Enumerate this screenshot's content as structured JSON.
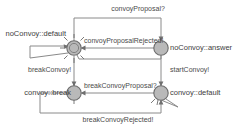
{
  "diagram": {
    "type": "state-machine",
    "colors": {
      "node_fill": "#b9b9b9",
      "node_stroke": "#6c6c6c",
      "edge_stroke": "#8a8a8a",
      "label_text": "#3d3d3d",
      "background": "#ffffff"
    },
    "nodes": [
      {
        "id": "noConvoy_default",
        "label": "noConvoy::default",
        "shape": "double-circle",
        "x": 74,
        "y": 48,
        "r": 7,
        "label_anchor": "end",
        "label_x": 66,
        "label_y": 36
      },
      {
        "id": "noConvoy_answer",
        "label": "noConvoy::answer",
        "shape": "circle",
        "x": 161,
        "y": 48,
        "r": 7,
        "label_anchor": "start",
        "label_x": 170,
        "label_y": 50
      },
      {
        "id": "convoy_break",
        "label": "convoy::break",
        "shape": "circle",
        "x": 74,
        "y": 93,
        "r": 7,
        "label_anchor": "end",
        "label_x": 70,
        "label_y": 95
      },
      {
        "id": "convoy_default",
        "label": "convoy::default",
        "shape": "circle",
        "x": 161,
        "y": 93,
        "r": 7,
        "label_anchor": "start",
        "label_x": 170,
        "label_y": 95
      }
    ],
    "edges": [
      {
        "id": "e-convoyProposal",
        "label": "convoyProposal?",
        "from": "noConvoy_default",
        "to": "noConvoy_answer",
        "route": "top-outer",
        "label_x": 138,
        "label_y": 11,
        "label_anchor": "middle"
      },
      {
        "id": "e-convoyProposalRejected",
        "label": "convoyProposalRejected!",
        "from": "noConvoy_answer",
        "to": "noConvoy_default",
        "route": "straight-horizontal",
        "label_x": 84,
        "label_y": 43,
        "label_anchor": "start"
      },
      {
        "id": "e-noConvoyDefault-self",
        "label": "",
        "from": "noConvoy_default",
        "to": "noConvoy_default",
        "route": "self-loop-left",
        "label_x": 0,
        "label_y": 0,
        "label_anchor": "middle"
      },
      {
        "id": "e-breakConvoy",
        "label": "breakConvoy!",
        "from": "noConvoy_default",
        "to": "convoy_break",
        "route": "vertical-left",
        "label_x": 28,
        "label_y": 72,
        "label_anchor": "start"
      },
      {
        "id": "e-startConvoy",
        "label": "startConvoy!",
        "from": "noConvoy_answer",
        "to": "convoy_default",
        "route": "vertical-right",
        "label_x": 170,
        "label_y": 72,
        "label_anchor": "start"
      },
      {
        "id": "e-breakConvoyProposal",
        "label": "breakConvoyProposal?",
        "from": "convoy_default",
        "to": "convoy_break",
        "route": "straight-horizontal",
        "label_x": 84,
        "label_y": 88,
        "label_anchor": "start"
      },
      {
        "id": "e-breakConvoyRejected",
        "label": "breakConvoyRejected!",
        "from": "convoy_break",
        "to": "convoy_default",
        "route": "bottom-outer",
        "label_x": 118,
        "label_y": 122,
        "label_anchor": "middle"
      }
    ]
  }
}
